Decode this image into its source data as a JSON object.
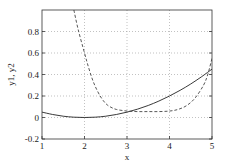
{
  "chart_data": {
    "type": "line",
    "title": "",
    "xlabel": "x",
    "ylabel": "y1, y2",
    "xlim": [
      1,
      5
    ],
    "ylim": [
      -0.2,
      1.0
    ],
    "xticks": [
      1,
      2,
      3,
      4,
      5
    ],
    "xtick_labels": [
      "1",
      "2",
      "3",
      "4",
      "5"
    ],
    "yticks": [
      -0.2,
      0,
      0.2,
      0.4,
      0.6,
      0.8
    ],
    "ytick_labels": [
      "-0.2",
      "0",
      "0.2",
      "0.4",
      "0.6",
      "0.8"
    ],
    "grid": true,
    "legend": null,
    "series": [
      {
        "name": "y1",
        "style": "solid",
        "x": [
          1.0,
          1.25,
          1.5,
          1.75,
          2.0,
          2.25,
          2.5,
          2.75,
          3.0,
          3.25,
          3.5,
          3.75,
          4.0,
          4.25,
          4.5,
          4.75,
          5.0
        ],
        "y": [
          0.05,
          0.028,
          0.012,
          0.003,
          0.0,
          0.003,
          0.012,
          0.028,
          0.05,
          0.078,
          0.112,
          0.153,
          0.2,
          0.253,
          0.312,
          0.378,
          0.45
        ]
      },
      {
        "name": "y2",
        "style": "dashed",
        "x": [
          1.75,
          1.85,
          2.0,
          2.1,
          2.2,
          2.3,
          2.4,
          2.5,
          2.6,
          2.75,
          3.0,
          3.25,
          3.5,
          3.75,
          4.0,
          4.2,
          4.4,
          4.6,
          4.8,
          4.9,
          5.0
        ],
        "y": [
          1.0,
          0.82,
          0.6,
          0.46,
          0.34,
          0.25,
          0.18,
          0.13,
          0.1,
          0.075,
          0.06,
          0.055,
          0.055,
          0.055,
          0.06,
          0.075,
          0.11,
          0.18,
          0.3,
          0.4,
          0.55
        ]
      }
    ]
  }
}
